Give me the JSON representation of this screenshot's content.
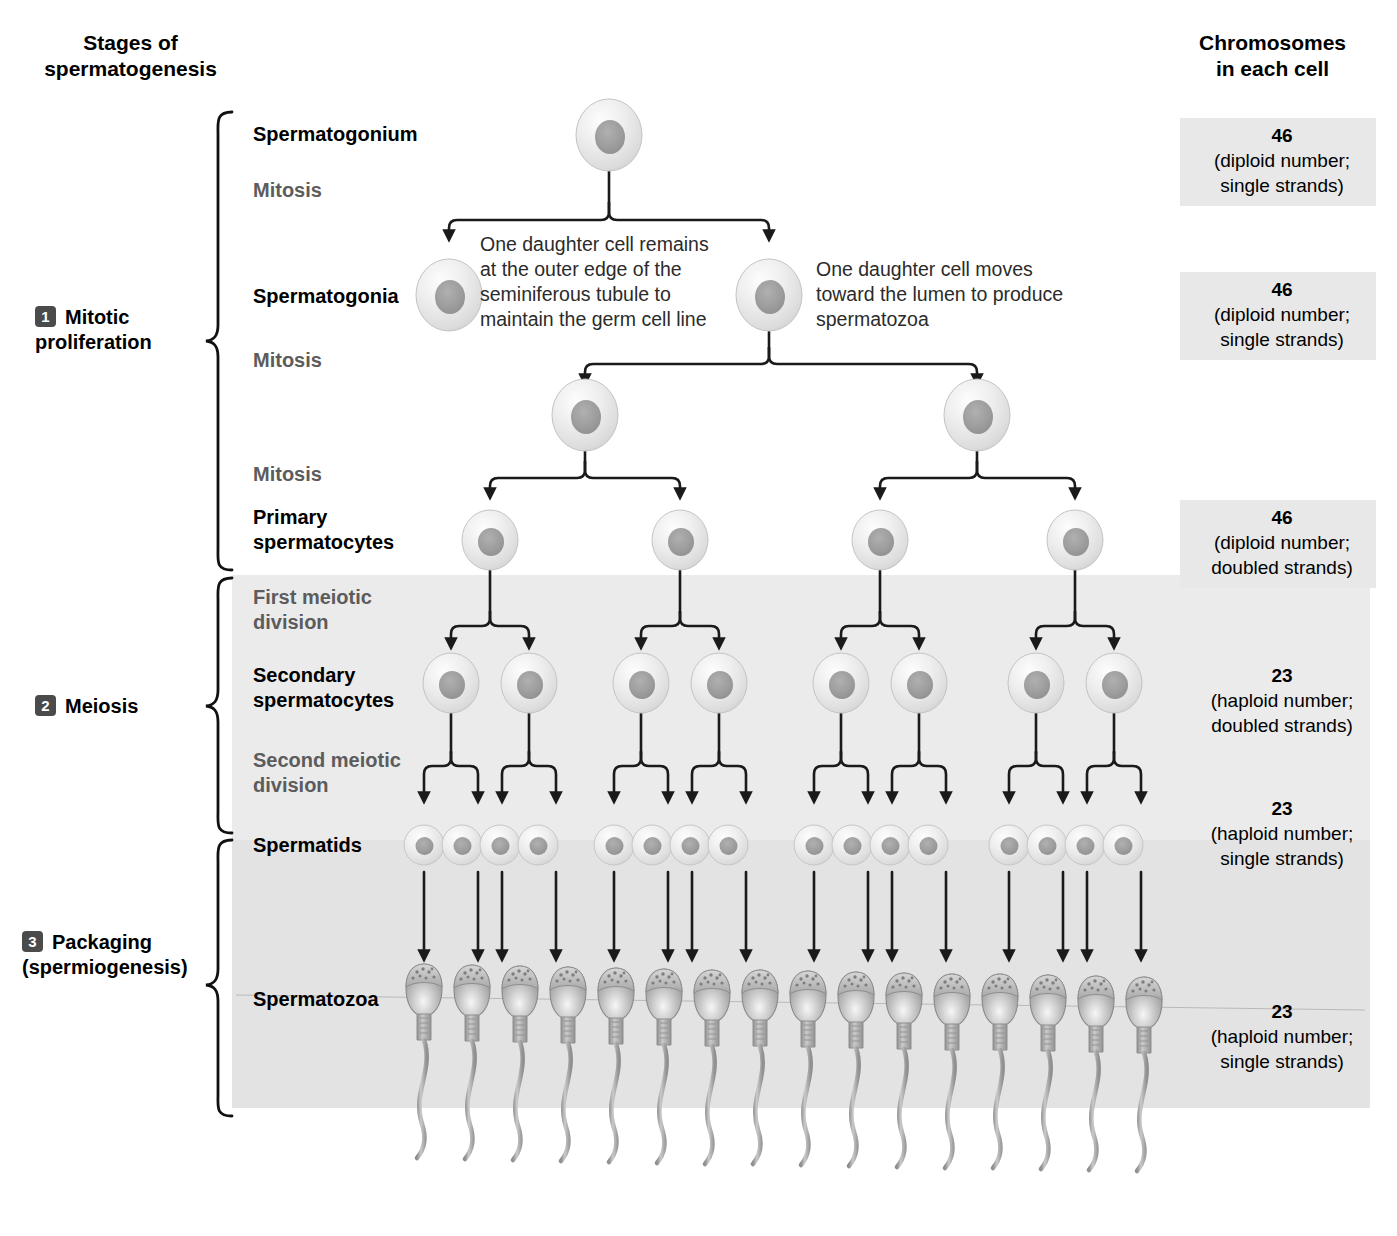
{
  "header": {
    "left_title_line1": "Stages of",
    "left_title_line2": "spermatogenesis",
    "right_title_line1": "Chromosomes",
    "right_title_line2": "in each cell"
  },
  "stages": [
    {
      "number": "1",
      "line1": "Mitotic",
      "line2": "proliferation"
    },
    {
      "number": "2",
      "line1": "Meiosis",
      "line2": ""
    },
    {
      "number": "3",
      "line1": "Packaging",
      "line2": "(spermiogenesis)"
    }
  ],
  "rows": [
    {
      "label": "Spermatogonium",
      "kind": "bold"
    },
    {
      "label": "Mitosis",
      "kind": "light"
    },
    {
      "label": "Spermatogonia",
      "kind": "bold"
    },
    {
      "label": "Mitosis",
      "kind": "light"
    },
    {
      "label": "Mitosis",
      "kind": "light"
    },
    {
      "label_line1": "Primary",
      "label_line2": "spermatocytes",
      "kind": "bold"
    },
    {
      "label_line1": "First meiotic",
      "label_line2": "division",
      "kind": "light"
    },
    {
      "label_line1": "Secondary",
      "label_line2": "spermatocytes",
      "kind": "bold"
    },
    {
      "label_line1": "Second meiotic",
      "label_line2": "division",
      "kind": "light"
    },
    {
      "label": "Spermatids",
      "kind": "bold"
    },
    {
      "label": "Spermatozoa",
      "kind": "bold"
    }
  ],
  "chromosome_boxes": [
    {
      "number": "46",
      "detail_line1": "(diploid number;",
      "detail_line2": "single strands)"
    },
    {
      "number": "46",
      "detail_line1": "(diploid number;",
      "detail_line2": "single strands)"
    },
    {
      "number": "46",
      "detail_line1": "(diploid number;",
      "detail_line2": "doubled strands)"
    },
    {
      "number": "23",
      "detail_line1": "(haploid number;",
      "detail_line2": "doubled strands)"
    },
    {
      "number": "23",
      "detail_line1": "(haploid number;",
      "detail_line2": "single strands)"
    },
    {
      "number": "23",
      "detail_line1": "(haploid number;",
      "detail_line2": "single strands)"
    }
  ],
  "callouts": [
    {
      "line1": "One daughter cell remains",
      "line2": "at the outer edge of the",
      "line3": "seminiferous tubule to",
      "line4": "maintain the germ cell line"
    },
    {
      "line1": "One daughter cell moves",
      "line2": "toward the lumen to produce",
      "line3": "spermatozoa",
      "line4": ""
    }
  ],
  "colors": {
    "panel_meiosis": "#ebebeb",
    "panel_packaging": "#e3e3e3",
    "chrom_band": "#e8e8e8",
    "badge": "#4b4b4b",
    "connector": "#1a1a1a",
    "label_light": "#5c5c5c",
    "cell_body": "#e9e9e9",
    "cell_nucleus": "#9a9a9a"
  },
  "counts": {
    "spermatogonium": 1,
    "spermatogonia": 2,
    "mitosis_round3": 2,
    "primary_spermatocytes": 4,
    "secondary_spermatocytes": 8,
    "spermatids": 16,
    "spermatozoa": 16
  }
}
